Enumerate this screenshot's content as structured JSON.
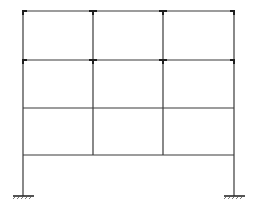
{
  "diagram": {
    "type": "multi-storey rigid frame",
    "bays": 3,
    "storeys": 4,
    "colors": {
      "member": "#3a3a3a",
      "joint": "#1e1e1e",
      "background": "#ffffff"
    },
    "columns_x": [
      23,
      93,
      163,
      234
    ],
    "beams_y": [
      11,
      60,
      108,
      155
    ],
    "base_y": 196,
    "outer_columns_extend_to_base": true,
    "stiffened_joints_rows": [
      0,
      1
    ],
    "supports": [
      {
        "name": "left-fixed-support",
        "x": 23
      },
      {
        "name": "right-fixed-support",
        "x": 234
      }
    ]
  }
}
